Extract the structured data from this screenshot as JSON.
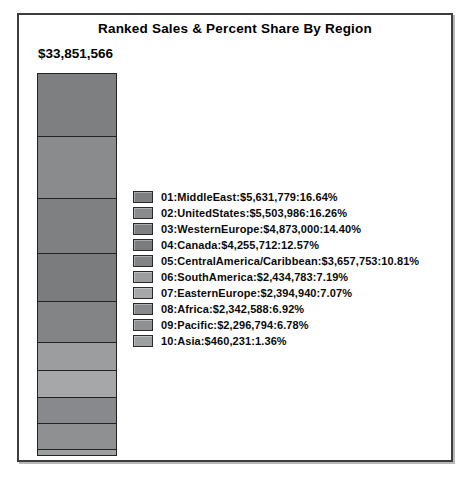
{
  "chart_data": {
    "type": "bar",
    "subtype": "single-stacked-vertical-bar",
    "title": "Ranked Sales & Percent Share By Region",
    "total_label": "$33,851,566",
    "total_value": 33851566,
    "stack_order": "top-to-bottom-by-rank",
    "legend_position": "right-middle",
    "grid": false,
    "axes_shown": false,
    "series": [
      {
        "rank": "01",
        "region": "MiddleEast",
        "sales": "$5,631,779",
        "sales_value": 5631779,
        "percent": 16.64,
        "percent_label": "16.64%",
        "color": "#7d7f81",
        "label": "01:MiddleEast:$5,631,779:16.64%"
      },
      {
        "rank": "02",
        "region": "UnitedStates",
        "sales": "$5,503,986",
        "sales_value": 5503986,
        "percent": 16.26,
        "percent_label": "16.26%",
        "color": "#898b8d",
        "label": "02:UnitedStates:$5,503,986:16.26%"
      },
      {
        "rank": "03",
        "region": "WesternEurope",
        "sales": "$4,873,000",
        "sales_value": 4873000,
        "percent": 14.4,
        "percent_label": "14.40%",
        "color": "#7e8082",
        "label": "03:WesternEurope:$4,873,000:14.40%"
      },
      {
        "rank": "04",
        "region": "Canada",
        "sales": "$4,255,712",
        "sales_value": 4255712,
        "percent": 12.57,
        "percent_label": "12.57%",
        "color": "#7a7c7e",
        "label": "04:Canada:$4,255,712:12.57%"
      },
      {
        "rank": "05",
        "region": "CentralAmerica/Caribbean",
        "sales": "$3,657,753",
        "sales_value": 3657753,
        "percent": 10.81,
        "percent_label": "10.81%",
        "color": "#828486",
        "label": "05:CentralAmerica/Caribbean:$3,657,753:10.81%"
      },
      {
        "rank": "06",
        "region": "SouthAmerica",
        "sales": "$2,434,783",
        "sales_value": 2434783,
        "percent": 7.19,
        "percent_label": "7.19%",
        "color": "#9b9d9f",
        "label": "06:SouthAmerica:$2,434,783:7.19%"
      },
      {
        "rank": "07",
        "region": "EasternEurope",
        "sales": "$2,394,940",
        "sales_value": 2394940,
        "percent": 7.07,
        "percent_label": "7.07%",
        "color": "#a5a7a8",
        "label": "07:EasternEurope:$2,394,940:7.07%"
      },
      {
        "rank": "08",
        "region": "Africa",
        "sales": "$2,342,588",
        "sales_value": 2342588,
        "percent": 6.92,
        "percent_label": "6.92%",
        "color": "#87898c",
        "label": "08:Africa:$2,342,588:6.92%"
      },
      {
        "rank": "09",
        "region": "Pacific",
        "sales": "$2,296,794",
        "sales_value": 2296794,
        "percent": 6.78,
        "percent_label": "6.78%",
        "color": "#8e9092",
        "label": "09:Pacific:$2,296,794:6.78%"
      },
      {
        "rank": "10",
        "region": "Asia",
        "sales": "$460,231",
        "sales_value": 460231,
        "percent": 1.36,
        "percent_label": "1.36%",
        "color": "#9da0a1",
        "label": "10:Asia:$460,231:1.36%"
      }
    ]
  },
  "colors": {
    "frame_border": "#3d3d3d",
    "segment_border": "#232323",
    "text": "#000000",
    "background": "#ffffff"
  }
}
